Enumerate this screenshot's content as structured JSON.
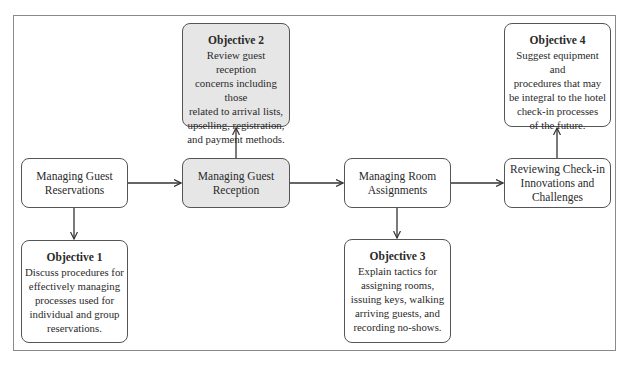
{
  "diagram": {
    "stages": [
      {
        "id": "A",
        "label": "Managing Guest\nReservations",
        "shaded": false
      },
      {
        "id": "B",
        "label": "Managing Guest\nReception",
        "shaded": true
      },
      {
        "id": "C",
        "label": "Managing Room\nAssignments",
        "shaded": false
      },
      {
        "id": "D",
        "label": "Reviewing Check-in\nInnovations and\nChallenges",
        "shaded": false
      }
    ],
    "objectives": [
      {
        "title": "Objective 1",
        "text": "Discuss procedures for\neffectively managing\nprocesses used for\nindividual and group\nreservations.",
        "linked_stage": "A",
        "position": "below",
        "shaded": false
      },
      {
        "title": "Objective 2",
        "text": "Review guest reception\nconcerns including those\nrelated to arrival lists,\nupselling, registration,\nand payment methods.",
        "linked_stage": "B",
        "position": "above",
        "shaded": true
      },
      {
        "title": "Objective 3",
        "text": "Explain tactics for\nassigning rooms,\nissuing keys, walking\narriving guests, and\nrecording no-shows.",
        "linked_stage": "C",
        "position": "below",
        "shaded": false
      },
      {
        "title": "Objective 4",
        "text": "Suggest equipment and\nprocedures that may\nbe integral to the hotel\ncheck-in processes\nof the future.",
        "linked_stage": "D",
        "position": "above",
        "shaded": false
      }
    ],
    "edges": [
      {
        "from": "A",
        "to": "B"
      },
      {
        "from": "B",
        "to": "C"
      },
      {
        "from": "C",
        "to": "D"
      },
      {
        "from": "A",
        "to": "Objective 1"
      },
      {
        "from": "B",
        "to": "Objective 2"
      },
      {
        "from": "C",
        "to": "Objective 3"
      },
      {
        "from": "D",
        "to": "Objective 4"
      }
    ],
    "colors": {
      "shaded_fill": "#e6e6e6",
      "box_border": "#555555",
      "frame_border": "#8a8a8a",
      "arrow": "#333333"
    }
  }
}
